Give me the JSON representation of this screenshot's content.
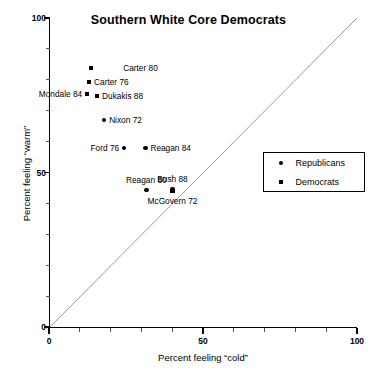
{
  "chart_data": {
    "type": "scatter",
    "title": "Southern White Core Democrats",
    "xlabel": "Percent feeling “cold”",
    "ylabel": "Percent feeling “warm”",
    "xlim": [
      0,
      100
    ],
    "ylim": [
      0,
      100
    ],
    "xticks": [
      0,
      50,
      100
    ],
    "xtick_labels": [
      "0",
      "50",
      "100"
    ],
    "yticks": [
      0,
      50,
      100
    ],
    "ytick_labels": [
      "0",
      "50",
      "100"
    ],
    "grid": false,
    "reference_line": {
      "name": "diagonal-equality-line",
      "from": [
        0,
        0
      ],
      "to": [
        100,
        100
      ],
      "color": "#9a9a9a"
    },
    "legend": {
      "position": "right-middle",
      "entries": [
        {
          "label": "Republicans",
          "marker": "circle"
        },
        {
          "label": "Democrats",
          "marker": "square"
        }
      ]
    },
    "series": [
      {
        "name": "Republicans",
        "marker": "circle",
        "color": "#000000",
        "points": [
          {
            "label": "Nixon 72",
            "x": 17.9,
            "y": 67.0,
            "label_pos": "right"
          },
          {
            "label": "Ford 76",
            "x": 24.4,
            "y": 57.9,
            "label_pos": "left"
          },
          {
            "label": "Reagan 84",
            "x": 31.3,
            "y": 57.9,
            "label_pos": "right"
          },
          {
            "label": "Reagan 80",
            "x": 31.6,
            "y": 44.3,
            "label_pos": "above"
          },
          {
            "label": "Bush 88",
            "x": 40.1,
            "y": 44.7,
            "label_pos": "above"
          }
        ]
      },
      {
        "name": "Democrats",
        "marker": "square",
        "color": "#000000",
        "points": [
          {
            "label": "Carter 80",
            "x": 13.7,
            "y": 83.8,
            "label_pos": "right-far"
          },
          {
            "label": "Carter 76",
            "x": 13.0,
            "y": 79.3,
            "label_pos": "right"
          },
          {
            "label": "Mondale 84",
            "x": 12.4,
            "y": 75.4,
            "label_pos": "left"
          },
          {
            "label": "Dukakis 88",
            "x": 15.6,
            "y": 74.8,
            "label_pos": "right"
          },
          {
            "label": "McGovern 72",
            "x": 40.1,
            "y": 44.0,
            "label_pos": "below"
          }
        ]
      }
    ]
  }
}
